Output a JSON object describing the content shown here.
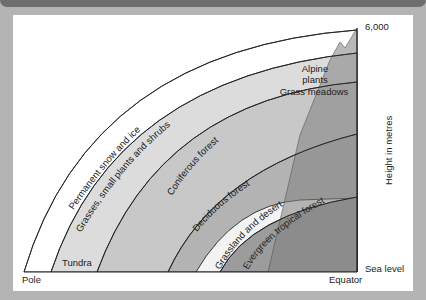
{
  "header": {
    "title": ""
  },
  "diagram": {
    "bands": [
      {
        "label": "Permanent snow and ice",
        "color": "#ffffff"
      },
      {
        "label": "Grasses, small plants and shrubs",
        "color": "#dcdcdc"
      },
      {
        "label": "Coniferous forest",
        "color": "#c6c6c6"
      },
      {
        "label": "Deciduous forest",
        "color": "#b2b2b2"
      },
      {
        "label": "Grassland and desert",
        "color": "#f2f2f2"
      },
      {
        "label": "Evergreen tropical forest",
        "color": "#9a9a9a"
      }
    ],
    "tundra_label": "Tundra",
    "alpine_label_line1": "Alpine",
    "alpine_label_line2": "plants",
    "meadow_label": "Grass meadows",
    "mountain_color": "#8a8a8a",
    "axis": {
      "top_value": "6,000",
      "y_label": "Height in metres",
      "bottom_value": "Sea level",
      "left_x_label": "Pole",
      "right_x_label": "Equator"
    }
  }
}
